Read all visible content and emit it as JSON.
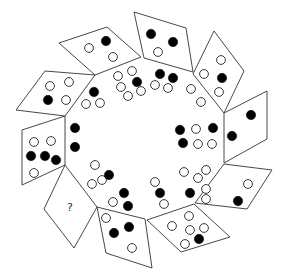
{
  "puzzle": {
    "question_mark": "?",
    "dot_radius": 5,
    "colors": {
      "stroke": "#333333",
      "filled": "#000000",
      "open": "#ffffff"
    },
    "tiles": [
      {
        "id": "tile-top-left",
        "points": "59,43 107,27 141,57 95,75",
        "dots": [
          [
            89,
            48,
            "open"
          ],
          [
            106,
            41,
            "filled"
          ],
          [
            113,
            57,
            "open"
          ]
        ]
      },
      {
        "id": "tile-top",
        "points": "134,12 186,28 193,72 144,58",
        "dots": [
          [
            151,
            34,
            "filled"
          ],
          [
            173,
            42,
            "filled"
          ],
          [
            158,
            52,
            "open"
          ]
        ]
      },
      {
        "id": "tile-upper-right",
        "points": "214,31 244,71 224,113 193,74",
        "dots": [
          [
            221,
            60,
            "open"
          ],
          [
            204,
            74,
            "open"
          ],
          [
            222,
            78,
            "filled"
          ],
          [
            219,
            92,
            "open"
          ]
        ]
      },
      {
        "id": "tile-right",
        "points": "224,113 267,91 267,139 224,163",
        "dots": [
          [
            251,
            115,
            "filled"
          ],
          [
            232,
            136,
            "filled"
          ]
        ]
      },
      {
        "id": "tile-lower-right",
        "points": "224,164 272,170 247,209 195,203",
        "dots": [
          [
            248,
            184,
            "open"
          ],
          [
            206,
            199,
            "open"
          ],
          [
            238,
            201,
            "filled"
          ]
        ]
      },
      {
        "id": "tile-bottom-right",
        "points": "194,204 230,237 181,252 147,220",
        "dots": [
          [
            189,
            216,
            "open"
          ],
          [
            172,
            226,
            "open"
          ],
          [
            190,
            230,
            "open"
          ],
          [
            204,
            228,
            "open"
          ],
          [
            199,
            239,
            "filled"
          ],
          [
            185,
            244,
            "open"
          ]
        ]
      },
      {
        "id": "tile-bottom",
        "points": "97,207 145,219 152,268 106,253",
        "dots": [
          [
            106,
            218,
            "open"
          ],
          [
            114,
            233,
            "filled"
          ],
          [
            129,
            227,
            "filled"
          ],
          [
            132,
            248,
            "open"
          ]
        ]
      },
      {
        "id": "tile-question",
        "points": "65,165 97,207 74,248 44,209",
        "dots": [],
        "label": "?"
      },
      {
        "id": "tile-left",
        "points": "22,130 65,116 65,165 22,185",
        "dots": [
          [
            34,
            142,
            "open"
          ],
          [
            51,
            141,
            "open"
          ],
          [
            31,
            156,
            "filled"
          ],
          [
            45,
            156,
            "filled"
          ],
          [
            56,
            160,
            "filled"
          ],
          [
            34,
            173,
            "open"
          ]
        ]
      },
      {
        "id": "tile-upper-left",
        "points": "45,71 95,75 65,116 16,110",
        "dots": [
          [
            50,
            86,
            "open"
          ],
          [
            69,
            82,
            "open"
          ],
          [
            48,
            100,
            "filled"
          ],
          [
            66,
            100,
            "open"
          ]
        ]
      }
    ],
    "inner_dots": [
      [
        94,
        92,
        "filled"
      ],
      [
        86,
        104,
        "open"
      ],
      [
        100,
        103,
        "open"
      ],
      [
        118,
        76,
        "open"
      ],
      [
        132,
        71,
        "open"
      ],
      [
        137,
        82,
        "filled"
      ],
      [
        121,
        87,
        "open"
      ],
      [
        128,
        96,
        "open"
      ],
      [
        141,
        91,
        "open"
      ],
      [
        160,
        74,
        "filled"
      ],
      [
        173,
        78,
        "filled"
      ],
      [
        155,
        85,
        "open"
      ],
      [
        168,
        88,
        "open"
      ],
      [
        191,
        89,
        "open"
      ],
      [
        201,
        102,
        "open"
      ],
      [
        75,
        128,
        "filled"
      ],
      [
        75,
        147,
        "filled"
      ],
      [
        95,
        165,
        "open"
      ],
      [
        102,
        180,
        "open"
      ],
      [
        109,
        175,
        "filled"
      ],
      [
        92,
        184,
        "open"
      ],
      [
        124,
        193,
        "filled"
      ],
      [
        128,
        206,
        "filled"
      ],
      [
        113,
        202,
        "open"
      ],
      [
        180,
        130,
        "filled"
      ],
      [
        196,
        129,
        "open"
      ],
      [
        213,
        128,
        "filled"
      ],
      [
        183,
        143,
        "filled"
      ],
      [
        198,
        144,
        "open"
      ],
      [
        212,
        144,
        "open"
      ],
      [
        155,
        182,
        "open"
      ],
      [
        160,
        193,
        "filled"
      ],
      [
        164,
        204,
        "open"
      ],
      [
        184,
        172,
        "open"
      ],
      [
        206,
        170,
        "open"
      ],
      [
        198,
        178,
        "open"
      ],
      [
        190,
        193,
        "filled"
      ],
      [
        206,
        189,
        "open"
      ]
    ]
  }
}
